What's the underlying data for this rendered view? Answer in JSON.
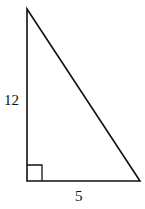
{
  "diagram": {
    "type": "right-triangle",
    "labels": {
      "vertical_leg": "12",
      "horizontal_leg": "5"
    },
    "right_angle_marker": true,
    "stroke_color": "#111111",
    "background": "#ffffff"
  }
}
